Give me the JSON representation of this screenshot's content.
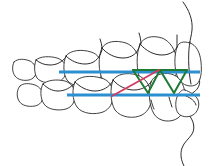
{
  "figure": {
    "width": 211,
    "height": 166,
    "background_color": "#ffffff"
  },
  "colors": {
    "outline": "#2b2b2b",
    "occlusal_plane_blue": "#2a90d0",
    "elastic_red": "#d23a5e",
    "elastic_green": "#1f7a33",
    "tooth_fill": "#ffffff"
  },
  "chart_data": {
    "type": "diagram",
    "elements": [
      {
        "name": "upper-occlusal-plane",
        "kind": "line",
        "color": "#2a90d0",
        "stroke_width": 3.2,
        "points": [
          [
            59,
            72
          ],
          [
            200,
            72
          ]
        ]
      },
      {
        "name": "lower-occlusal-plane",
        "kind": "line",
        "color": "#2a90d0",
        "stroke_width": 3.2,
        "points": [
          [
            67,
            95
          ],
          [
            200,
            95
          ]
        ]
      },
      {
        "name": "red-diagonal-elastic",
        "kind": "line",
        "color": "#d23a5e",
        "stroke_width": 1.8,
        "points": [
          [
            112,
            96
          ],
          [
            159,
            70
          ]
        ]
      },
      {
        "name": "green-zigzag-elastics",
        "kind": "polyline",
        "color": "#1f7a33",
        "stroke_width": 2.0,
        "points": [
          [
            133,
            70
          ],
          [
            148,
            93
          ],
          [
            160,
            70
          ],
          [
            174,
            93
          ],
          [
            187,
            70
          ]
        ]
      },
      {
        "name": "green-top-chord",
        "kind": "line",
        "color": "#1f7a33",
        "stroke_width": 2.0,
        "points": [
          [
            133,
            70
          ],
          [
            187,
            70
          ]
        ]
      }
    ],
    "annotations": []
  },
  "geometry": {
    "upper_teeth": [
      {
        "name": "upper-molar-posterior",
        "path": "M14,62 C12,66 12,72 15,76 C18,80 24,81 29,80 C33,79 36,76 36,72 C36,67 34,63 30,61 C25,59 18,58 14,62 Z"
      },
      {
        "name": "upper-molar-second",
        "path": "M36,60 C34,65 34,73 37,78 C41,83 51,84 58,82 C63,80 66,76 66,70 C66,64 63,60 57,58 C50,56 40,56 36,60 Z"
      },
      {
        "name": "upper-molar-first",
        "path": "M66,56 C63,62 63,74 67,80 C72,87 85,88 93,85 C99,82 102,77 102,69 C102,60 98,54 91,52 C82,49 70,50 66,56 Z"
      },
      {
        "name": "upper-premolar",
        "path": "M102,48 C98,56 98,72 103,80 C109,88 123,89 131,85 C138,81 141,74 140,65 C139,54 134,46 126,43 C116,40 106,41 102,48 Z"
      },
      {
        "name": "upper-canine",
        "path": "M140,44 C136,53 136,72 141,81 C147,90 160,91 168,86 C175,81 178,73 177,62 C176,50 170,41 162,38 C152,35 144,37 140,44 Z"
      },
      {
        "name": "upper-incisor",
        "path": "M177,47 C174,55 174,70 178,78 C182,86 192,88 197,84 C201,80 202,72 201,62 C200,52 196,45 190,43 C183,41 179,42 177,47 Z"
      }
    ],
    "lower_teeth": [
      {
        "name": "lower-molar-posterior",
        "path": "M20,86 C17,89 16,96 19,101 C22,106 29,107 35,106 C40,105 43,101 43,96 C43,91 40,87 35,85 C29,83 23,83 20,86 Z"
      },
      {
        "name": "lower-molar-second",
        "path": "M43,84 C40,89 40,98 44,104 C48,110 59,111 66,109 C72,107 75,102 75,95 C75,88 71,83 65,81 C57,79 47,80 43,84 Z"
      },
      {
        "name": "lower-molar-first",
        "path": "M75,82 C72,88 72,100 77,107 C82,114 95,115 103,112 C110,109 113,103 113,95 C113,86 109,80 101,78 C91,75 79,76 75,82 Z"
      },
      {
        "name": "lower-premolar",
        "path": "M113,80 C110,87 110,102 115,110 C121,118 134,119 142,115 C149,111 152,104 151,95 C150,84 145,78 137,75 C127,72 117,74 113,80 Z"
      },
      {
        "name": "lower-canine",
        "path": "M151,82 C148,90 149,106 154,114 C159,122 171,123 178,118 C184,113 186,105 185,94 C184,83 179,76 171,74 C162,72 154,75 151,82 Z"
      }
    ],
    "detail_lines": [
      {
        "name": "upper-gingival-line-1",
        "path": "M36,60 C40,63 44,65 50,65 C57,65 62,62 66,57"
      },
      {
        "name": "upper-gingival-line-2",
        "path": "M66,56 C71,61 78,64 85,64 C93,64 99,60 102,50"
      },
      {
        "name": "upper-gingival-line-3",
        "path": "M102,48 C107,54 115,58 123,58 C132,58 138,53 140,45"
      },
      {
        "name": "upper-gingival-line-4",
        "path": "M140,44 C146,51 154,55 162,55 C171,55 176,50 177,47"
      },
      {
        "name": "lower-gingival-line-1",
        "path": "M43,84 C47,88 52,91 58,91 C65,91 70,88 75,83"
      },
      {
        "name": "lower-gingival-line-2",
        "path": "M75,82 C80,87 87,91 95,91 C103,91 109,87 113,81"
      },
      {
        "name": "lower-gingival-line-3",
        "path": "M113,80 C118,86 126,90 134,90 C143,90 149,85 151,82"
      }
    ],
    "cusp_marks": [
      {
        "name": "cusp-mark-1",
        "path": "M151,100 C152,104 153,107 154,109"
      },
      {
        "name": "cusp-mark-2",
        "path": "M169,97 C170,101 171,104 172,107"
      },
      {
        "name": "cusp-mark-3",
        "path": "M141,44 C141,40 140,36 139,33"
      },
      {
        "name": "cusp-mark-4",
        "path": "M177,46 C177,42 177,38 177,35"
      },
      {
        "name": "cusp-mark-5",
        "path": "M102,49 C102,45 101,42 100,39"
      }
    ],
    "incisor_extra": [
      {
        "name": "upper-incisor-inner",
        "path": "M190,42 C188,50 188,70 191,84"
      },
      {
        "name": "lower-incisor-extra",
        "path": "M185,90 C190,92 196,95 198,100 C200,105 198,112 193,115 C188,118 181,117 178,113"
      },
      {
        "name": "lower-incisor-extra-2",
        "path": "M186,96 C191,98 195,101 196,105"
      }
    ],
    "profile": {
      "name": "facial-profile",
      "path": "M183,2 C189,10 193,20 192,30 C191,40 187,48 189,58 C191,67 197,72 199,78 C201,84 198,89 194,92 C190,95 186,97 185,102 C184,108 188,113 191,118 C194,123 195,129 192,134 C189,139 184,142 182,148 C180,154 181,160 184,166"
    }
  }
}
